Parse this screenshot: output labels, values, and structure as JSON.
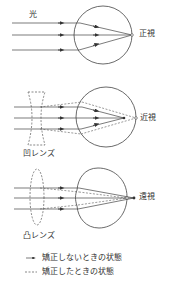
{
  "labels": {
    "light": "光",
    "normal": "正視",
    "myopia": "近視",
    "hyperopia": "遠視",
    "concave_lens": "凹レンズ",
    "convex_lens": "凸レンズ"
  },
  "legend": {
    "items": [
      {
        "symbol": "→",
        "style": "solid-arrow",
        "label": "矯正しないときの状態"
      },
      {
        "symbol": "---",
        "style": "dashed",
        "label": "矯正したときの状態"
      }
    ]
  },
  "colors": {
    "line": "#444444",
    "background": "#ffffff"
  }
}
